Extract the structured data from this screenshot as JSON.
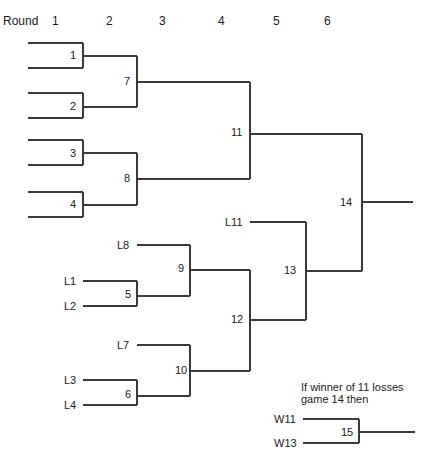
{
  "header": {
    "round_label": "Round",
    "rounds": [
      "1",
      "2",
      "3",
      "4",
      "5",
      "6"
    ]
  },
  "games": {
    "g1": "1",
    "g2": "2",
    "g3": "3",
    "g4": "4",
    "g5": "5",
    "g6": "6",
    "g7": "7",
    "g8": "8",
    "g9": "9",
    "g10": "10",
    "g11": "11",
    "g12": "12",
    "g13": "13",
    "g14": "14",
    "g15": "15"
  },
  "entrants": {
    "L1": "L1",
    "L2": "L2",
    "L3": "L3",
    "L4": "L4",
    "L7": "L7",
    "L8": "L8",
    "L11": "L11",
    "W11": "W11",
    "W13": "W13"
  },
  "note": {
    "line1": "If winner of 11 losses",
    "line2": "game 14 then"
  },
  "colors": {
    "line": "#3a3a3a",
    "text": "#1a1a1a",
    "background": "#ffffff"
  }
}
